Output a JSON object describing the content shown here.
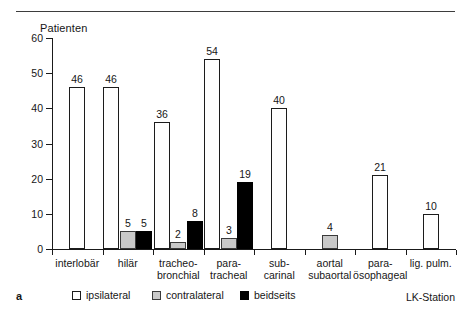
{
  "panel_label": "a",
  "chart_data": {
    "type": "bar",
    "title": "",
    "ylabel": "Patienten",
    "xlabel": "LK-Station",
    "ylim": [
      0,
      60
    ],
    "yticks": [
      0,
      10,
      20,
      30,
      40,
      50,
      60
    ],
    "grid": false,
    "legend_position": "bottom",
    "categories": [
      "interlobär",
      "hilär",
      "tracheo-\nbronchial",
      "para-\ntracheal",
      "sub-\ncarinal",
      "aortal\nsubaortal",
      "para-\nösophageal",
      "lig. pulm."
    ],
    "series": [
      {
        "name": "ipsilateral",
        "color": "#ffffff",
        "values": [
          46,
          46,
          36,
          54,
          40,
          null,
          21,
          10
        ]
      },
      {
        "name": "contralateral",
        "color": "#c9c9c9",
        "values": [
          null,
          5,
          2,
          3,
          null,
          4,
          null,
          null
        ]
      },
      {
        "name": "beidseits",
        "color": "#000000",
        "values": [
          null,
          5,
          8,
          19,
          null,
          null,
          null,
          null
        ]
      }
    ]
  },
  "categories_display": [
    {
      "line1": "interlobär",
      "line2": ""
    },
    {
      "line1": "hilär",
      "line2": ""
    },
    {
      "line1": "tracheo-",
      "line2": "bronchial"
    },
    {
      "line1": "para-",
      "line2": "tracheal"
    },
    {
      "line1": "sub-",
      "line2": "carinal"
    },
    {
      "line1": "aortal",
      "line2": "subaortal"
    },
    {
      "line1": "para-",
      "line2": "ösophageal"
    },
    {
      "line1": "lig. pulm.",
      "line2": ""
    }
  ],
  "y_tick_labels": [
    "60",
    "50",
    "40",
    "30",
    "20",
    "10",
    "0"
  ],
  "bars": [
    {
      "name": "bar-interlobaer-ipsilateral",
      "group": 0,
      "series": "ipsi",
      "value": 46,
      "label": "46"
    },
    {
      "name": "bar-hilaer-ipsilateral",
      "group": 1,
      "series": "ipsi",
      "value": 46,
      "label": "46"
    },
    {
      "name": "bar-hilaer-contralateral",
      "group": 1,
      "series": "contra",
      "value": 5,
      "label": "5"
    },
    {
      "name": "bar-hilaer-beidseits",
      "group": 1,
      "series": "beid",
      "value": 5,
      "label": "5"
    },
    {
      "name": "bar-tracheobronchial-ipsilateral",
      "group": 2,
      "series": "ipsi",
      "value": 36,
      "label": "36"
    },
    {
      "name": "bar-tracheobronchial-contralateral",
      "group": 2,
      "series": "contra",
      "value": 2,
      "label": "2"
    },
    {
      "name": "bar-tracheobronchial-beidseits",
      "group": 2,
      "series": "beid",
      "value": 8,
      "label": "8"
    },
    {
      "name": "bar-paratracheal-ipsilateral",
      "group": 3,
      "series": "ipsi",
      "value": 54,
      "label": "54"
    },
    {
      "name": "bar-paratracheal-contralateral",
      "group": 3,
      "series": "contra",
      "value": 3,
      "label": "3"
    },
    {
      "name": "bar-paratracheal-beidseits",
      "group": 3,
      "series": "beid",
      "value": 19,
      "label": "19"
    },
    {
      "name": "bar-subcarinal-ipsilateral",
      "group": 4,
      "series": "ipsi",
      "value": 40,
      "label": "40"
    },
    {
      "name": "bar-aortalsubaortal-contralateral",
      "group": 5,
      "series": "contra",
      "value": 4,
      "label": "4"
    },
    {
      "name": "bar-paraoesophageal-ipsilateral",
      "group": 6,
      "series": "ipsi",
      "value": 21,
      "label": "21"
    },
    {
      "name": "bar-ligpulm-ipsilateral",
      "group": 7,
      "series": "ipsi",
      "value": 10,
      "label": "10"
    }
  ],
  "legend": {
    "items": [
      {
        "label": "ipsilateral",
        "swatch": "ipsi"
      },
      {
        "label": "contralateral",
        "swatch": "contra"
      },
      {
        "label": "beidseits",
        "swatch": "beid"
      }
    ]
  }
}
